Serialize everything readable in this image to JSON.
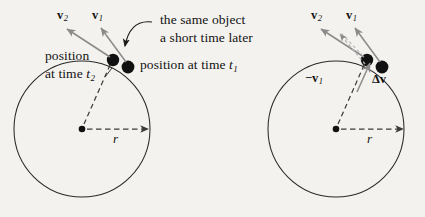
{
  "figure": {
    "type": "physics-diagram",
    "topic": "uniform circular motion and change in velocity",
    "background_color": "#f4f2ef",
    "ink_color": "#121212",
    "vector_gray": "#8a8a8a"
  },
  "left_panel": {
    "name": "positions-and-velocities",
    "circle": {
      "cx": 82,
      "cy": 129,
      "r": 68
    },
    "center_dot_label": "",
    "radius_label": "r",
    "annotations": {
      "callout_line1": "the same object",
      "callout_line2": "a short time later",
      "position_t2_line1": "position",
      "position_t2_line2": "at time",
      "position_t2_sub": "t",
      "position_t2_subscript": "2",
      "position_t1": "position at time",
      "position_t1_sub": "t",
      "position_t1_subscript": "1"
    },
    "vectors": [
      {
        "name": "v2",
        "symbol": "v",
        "subscript": "2"
      },
      {
        "name": "v1",
        "symbol": "v",
        "subscript": "1"
      }
    ]
  },
  "right_panel": {
    "name": "velocity-difference",
    "circle": {
      "cx": 336,
      "cy": 129,
      "r": 68
    },
    "radius_label": "r",
    "vectors": [
      {
        "name": "v2",
        "symbol": "v",
        "subscript": "2"
      },
      {
        "name": "v1",
        "symbol": "v",
        "subscript": "1"
      },
      {
        "name": "minus-v1",
        "symbol": "−v",
        "subscript": "1"
      },
      {
        "name": "delta-v",
        "symbol": "Δv",
        "subscript": ""
      }
    ]
  }
}
